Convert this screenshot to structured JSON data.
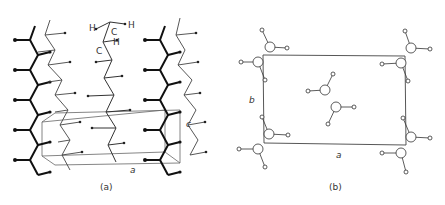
{
  "figure": {
    "panel_a": {
      "caption": "(a)",
      "atom_labels": [
        "H",
        "C",
        "H",
        "C",
        "H"
      ],
      "axis_labels": {
        "a": "a",
        "c": "c"
      }
    },
    "panel_b": {
      "caption": "(b)",
      "axis_labels": {
        "a": "a",
        "b": "b"
      }
    }
  },
  "colors": {
    "line": "#222222",
    "thin": "#555555",
    "atom_fill": "#ffffff"
  }
}
